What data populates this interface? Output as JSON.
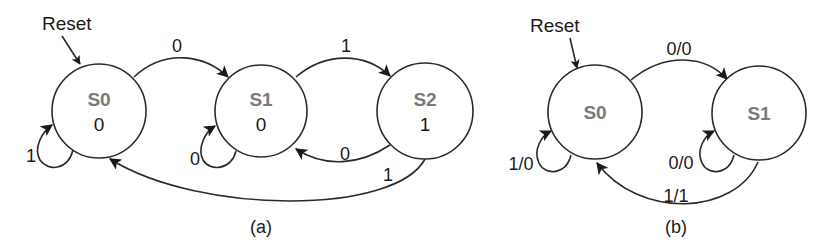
{
  "diagrams": [
    {
      "id": "a",
      "caption": "(a)",
      "type": "Moore machine",
      "reset_label": "Reset",
      "states": [
        {
          "name": "S0",
          "output": "0"
        },
        {
          "name": "S1",
          "output": "0"
        },
        {
          "name": "S2",
          "output": "1"
        }
      ],
      "transitions": [
        {
          "from": "S0",
          "to": "S0",
          "label": "1"
        },
        {
          "from": "S0",
          "to": "S1",
          "label": "0"
        },
        {
          "from": "S1",
          "to": "S1",
          "label": "0"
        },
        {
          "from": "S1",
          "to": "S2",
          "label": "1"
        },
        {
          "from": "S2",
          "to": "S1",
          "label": "0"
        },
        {
          "from": "S2",
          "to": "S0",
          "label": "1"
        }
      ]
    },
    {
      "id": "b",
      "caption": "(b)",
      "type": "Mealy machine",
      "reset_label": "Reset",
      "states": [
        {
          "name": "S0"
        },
        {
          "name": "S1"
        }
      ],
      "transitions": [
        {
          "from": "S0",
          "to": "S0",
          "label": "1/0"
        },
        {
          "from": "S0",
          "to": "S1",
          "label": "0/0"
        },
        {
          "from": "S1",
          "to": "S1",
          "label": "0/0"
        },
        {
          "from": "S1",
          "to": "S0",
          "label": "1/1"
        }
      ]
    }
  ],
  "colors": {
    "stroke": "#2a2a2a",
    "state_name": "#7a7a7a",
    "text": "#1a1a1a",
    "background": "#ffffff"
  }
}
